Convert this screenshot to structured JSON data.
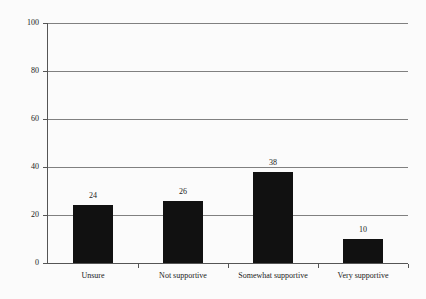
{
  "chart_data": {
    "type": "bar",
    "title": "",
    "subtitle": "",
    "xlabel": "",
    "ylabel": "",
    "categories": [
      "Unsure",
      "Not supportive",
      "Somewhat supportive",
      "Very supportive"
    ],
    "values": [
      24,
      26,
      38,
      10
    ],
    "value_labels": [
      "24",
      "26",
      "38",
      "10"
    ],
    "ylim": [
      0,
      100
    ],
    "ytick_labels": [
      "0",
      "20",
      "40",
      "60",
      "80",
      "100"
    ],
    "ytick_values": [
      0,
      20,
      40,
      60,
      80,
      100
    ],
    "grid": "horizontal",
    "legend": "none",
    "bar_color": "#111111",
    "grid_color": "#808080",
    "axis_color": "#555555",
    "background_color": "#fbfbfb",
    "text_color": "#1a1a1a"
  }
}
